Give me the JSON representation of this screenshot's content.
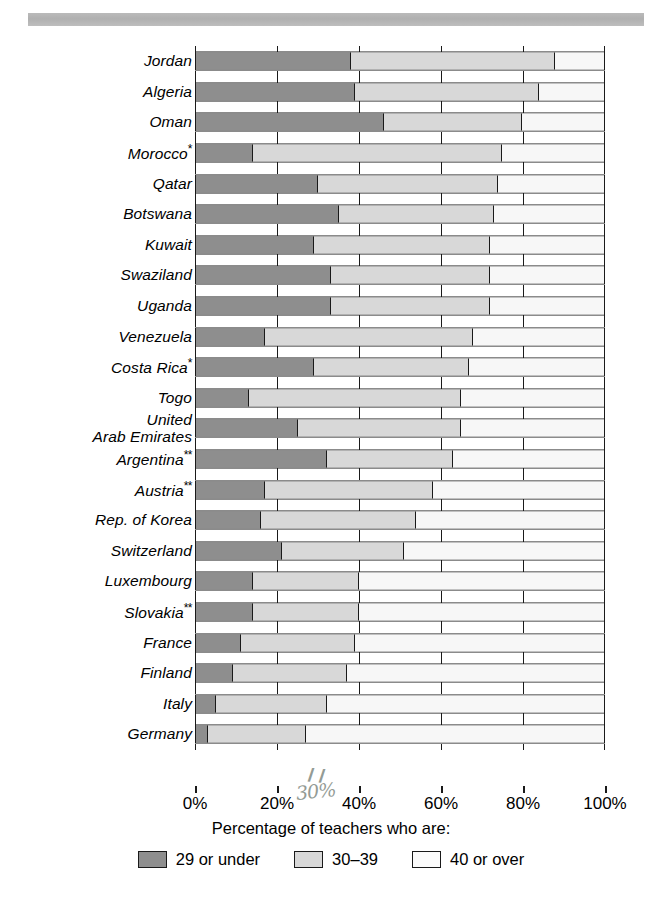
{
  "chart_data": {
    "type": "bar",
    "subtype": "horizontal-stacked-100",
    "title": "",
    "xlabel": "Percentage of teachers who are:",
    "ylabel": "",
    "xlim": [
      0,
      100
    ],
    "xticks": [
      "0%",
      "20%",
      "40%",
      "60%",
      "80%",
      "100%"
    ],
    "xtick_values": [
      0,
      20,
      40,
      60,
      80,
      100
    ],
    "grid": false,
    "legend_position": "bottom-center",
    "legend": [
      "29 or under",
      "30–39",
      "40 or over"
    ],
    "series": [
      {
        "name": "29 or under",
        "color": "#8e8e8e"
      },
      {
        "name": "30–39",
        "color": "#d8d8d8"
      },
      {
        "name": "40 or over",
        "color": "#f7f7f7"
      }
    ],
    "categories": [
      "Jordan",
      "Algeria",
      "Oman",
      "Morocco*",
      "Qatar",
      "Botswana",
      "Kuwait",
      "Swaziland",
      "Uganda",
      "Venezuela",
      "Costa Rica*",
      "Togo",
      "United Arab Emirates",
      "Argentina**",
      "Austria**",
      "Rep. of Korea",
      "Switzerland",
      "Luxembourg",
      "Slovakia**",
      "France",
      "Finland",
      "Italy",
      "Germany"
    ],
    "rows": [
      {
        "label": "Jordan",
        "label_line2": "",
        "footnote": "",
        "values": [
          38,
          50,
          12
        ]
      },
      {
        "label": "Algeria",
        "label_line2": "",
        "footnote": "",
        "values": [
          39,
          45,
          16
        ]
      },
      {
        "label": "Oman",
        "label_line2": "",
        "footnote": "",
        "values": [
          46,
          34,
          20
        ]
      },
      {
        "label": "Morocco",
        "label_line2": "",
        "footnote": "*",
        "values": [
          14,
          61,
          25
        ]
      },
      {
        "label": "Qatar",
        "label_line2": "",
        "footnote": "",
        "values": [
          30,
          44,
          26
        ]
      },
      {
        "label": "Botswana",
        "label_line2": "",
        "footnote": "",
        "values": [
          35,
          38,
          27
        ]
      },
      {
        "label": "Kuwait",
        "label_line2": "",
        "footnote": "",
        "values": [
          29,
          43,
          28
        ]
      },
      {
        "label": "Swaziland",
        "label_line2": "",
        "footnote": "",
        "values": [
          33,
          39,
          28
        ]
      },
      {
        "label": "Uganda",
        "label_line2": "",
        "footnote": "",
        "values": [
          33,
          39,
          28
        ]
      },
      {
        "label": "Venezuela",
        "label_line2": "",
        "footnote": "",
        "values": [
          17,
          51,
          32
        ]
      },
      {
        "label": "Costa Rica",
        "label_line2": "",
        "footnote": "*",
        "values": [
          29,
          38,
          33
        ]
      },
      {
        "label": "Togo",
        "label_line2": "",
        "footnote": "",
        "values": [
          13,
          52,
          35
        ]
      },
      {
        "label": "United",
        "label_line2": "Arab Emirates",
        "footnote": "",
        "values": [
          25,
          40,
          35
        ]
      },
      {
        "label": "Argentina",
        "label_line2": "",
        "footnote": "**",
        "values": [
          32,
          31,
          37
        ]
      },
      {
        "label": "Austria",
        "label_line2": "",
        "footnote": "**",
        "values": [
          17,
          41,
          42
        ]
      },
      {
        "label": "Rep. of Korea",
        "label_line2": "",
        "footnote": "",
        "values": [
          16,
          38,
          46
        ]
      },
      {
        "label": "Switzerland",
        "label_line2": "",
        "footnote": "",
        "values": [
          21,
          30,
          49
        ]
      },
      {
        "label": "Luxembourg",
        "label_line2": "",
        "footnote": "",
        "values": [
          14,
          26,
          60
        ]
      },
      {
        "label": "Slovakia",
        "label_line2": "",
        "footnote": "**",
        "values": [
          14,
          26,
          60
        ]
      },
      {
        "label": "France",
        "label_line2": "",
        "footnote": "",
        "values": [
          11,
          28,
          61
        ]
      },
      {
        "label": "Finland",
        "label_line2": "",
        "footnote": "",
        "values": [
          9,
          28,
          63
        ]
      },
      {
        "label": "Italy",
        "label_line2": "",
        "footnote": "",
        "values": [
          5,
          27,
          68
        ]
      },
      {
        "label": "Germany",
        "label_line2": "",
        "footnote": "",
        "values": [
          3,
          24,
          73
        ]
      }
    ]
  },
  "axis": {
    "title": "Percentage of teachers who are:",
    "ticks": [
      "0%",
      "20%",
      "40%",
      "60%",
      "80%",
      "100%"
    ]
  },
  "legend": {
    "items": [
      {
        "label": "29 or under",
        "color": "#8e8e8e"
      },
      {
        "label": "30–39",
        "color": "#d8d8d8"
      },
      {
        "label": "40 or over",
        "color": "#fbfbfb"
      }
    ]
  },
  "annotation": {
    "handwritten": "30%",
    "tickmark": "❙❙"
  }
}
